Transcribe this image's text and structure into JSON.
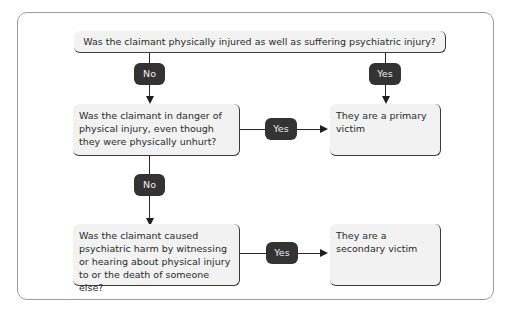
{
  "diagram": {
    "type": "flowchart",
    "nodes": {
      "q1": "Was the claimant physically injured as well as suffering psychiatric injury?",
      "q2": "Was the claimant in danger of physical injury, even though they were physically unhurt?",
      "r1": "They are a primary victim",
      "q3": "Was the claimant caused psychiatric harm by witnessing or hearing about physical injury to or the death of someone else?",
      "r2": "They are a secondary victim"
    },
    "edges": {
      "q1_no": "No",
      "q1_yes": "Yes",
      "q2_yes": "Yes",
      "q2_no": "No",
      "q3_yes": "Yes"
    }
  }
}
